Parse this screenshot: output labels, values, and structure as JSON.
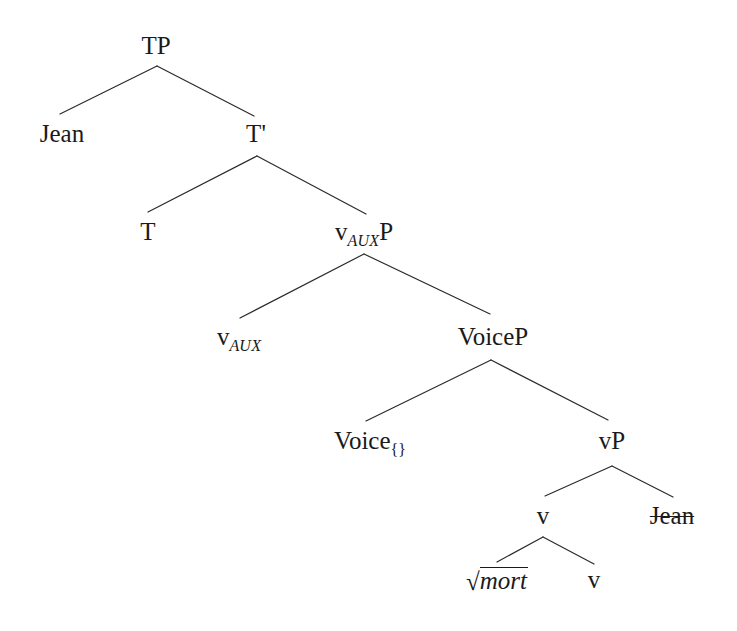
{
  "figure": {
    "type": "syntax-tree",
    "title": "",
    "background_color": "#ffffff",
    "line_color": "#2b2b2b",
    "text_color": "#1a1a1a"
  },
  "nodes": {
    "tp": {
      "label": "TP",
      "x": 156,
      "y": 33
    },
    "jean_subject": {
      "label": "Jean",
      "x": 62,
      "y": 121
    },
    "tbar": {
      "label": "T'",
      "x": 256,
      "y": 121
    },
    "t": {
      "label": "T",
      "x": 148,
      "y": 219
    },
    "vauxp": {
      "label": "v",
      "sub": "AUX",
      "tail": "P",
      "x": 364,
      "y": 219
    },
    "vaux": {
      "label": "v",
      "sub": "AUX",
      "tail": "",
      "x": 239,
      "y": 324
    },
    "voicep": {
      "label": "VoiceP",
      "x": 493,
      "y": 324
    },
    "voice_empty": {
      "label": "Voice",
      "sub_plain": "{}",
      "x": 370,
      "y": 428
    },
    "vp": {
      "label": "vP",
      "x": 612,
      "y": 428
    },
    "v_head": {
      "label": "v",
      "x": 543,
      "y": 503
    },
    "jean_trace": {
      "label": "Jean",
      "x": 672,
      "y": 503,
      "struck": true
    },
    "root_mort": {
      "radical": "√",
      "label": "mort",
      "x": 497,
      "y": 567
    },
    "v_little": {
      "label": "v",
      "x": 594,
      "y": 567
    }
  },
  "edges": [
    {
      "from": "tp",
      "to": "jean_subject",
      "x1": 157,
      "y1": 66,
      "x2": 60,
      "y2": 114
    },
    {
      "from": "tp",
      "to": "tbar",
      "x1": 157,
      "y1": 66,
      "x2": 254,
      "y2": 116
    },
    {
      "from": "tbar",
      "to": "t",
      "x1": 257,
      "y1": 156,
      "x2": 148,
      "y2": 212
    },
    {
      "from": "tbar",
      "to": "vauxp",
      "x1": 257,
      "y1": 156,
      "x2": 366,
      "y2": 214
    },
    {
      "from": "vauxp",
      "to": "vaux",
      "x1": 364,
      "y1": 254,
      "x2": 240,
      "y2": 318
    },
    {
      "from": "vauxp",
      "to": "voicep",
      "x1": 364,
      "y1": 254,
      "x2": 490,
      "y2": 314
    },
    {
      "from": "voicep",
      "to": "voice_empty",
      "x1": 491,
      "y1": 360,
      "x2": 366,
      "y2": 421
    },
    {
      "from": "voicep",
      "to": "vp",
      "x1": 491,
      "y1": 360,
      "x2": 608,
      "y2": 420
    },
    {
      "from": "vp",
      "to": "v_head",
      "x1": 612,
      "y1": 466,
      "x2": 545,
      "y2": 496
    },
    {
      "from": "vp",
      "to": "jean_trace",
      "x1": 612,
      "y1": 466,
      "x2": 673,
      "y2": 497
    },
    {
      "from": "v_head",
      "to": "root_mort",
      "x1": 543,
      "y1": 537,
      "x2": 497,
      "y2": 562
    },
    {
      "from": "v_head",
      "to": "v_little",
      "x1": 543,
      "y1": 537,
      "x2": 594,
      "y2": 564
    }
  ]
}
